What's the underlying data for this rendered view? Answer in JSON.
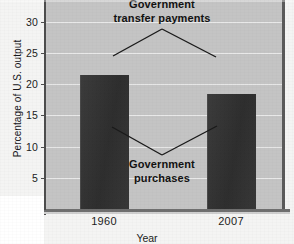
{
  "chart_data": {
    "type": "bar",
    "title": "",
    "xlabel": "Year",
    "ylabel": "Percentage of U.S. output",
    "categories": [
      "1960",
      "2007"
    ],
    "values": [
      21.5,
      18.5
    ],
    "series": [
      {
        "name": "Government purchases",
        "values": [
          21.5,
          18.5
        ]
      }
    ],
    "ylim": [
      0,
      35
    ],
    "ytick_labels": [
      "0",
      "5",
      "10",
      "15",
      "20",
      "25",
      "30",
      "35"
    ],
    "ytick_values": [
      0,
      5,
      10,
      15,
      20,
      25,
      30,
      35
    ],
    "grid": true,
    "legend_position": "none",
    "annotations": [
      {
        "id": "transfer",
        "text_line1": "Government",
        "text_line2": "transfer payments",
        "full_text": "Government transfer payments"
      },
      {
        "id": "purchases",
        "text_line1": "Government",
        "text_line2": "purchases",
        "full_text": "Government purchases"
      }
    ],
    "colors": {
      "bar": "#313131",
      "plot_background": "#c4c4c4",
      "gridline": "#e9e9e9",
      "axis": "#4d4d4d",
      "text": "#1c1c1c",
      "annotation_text": "#121212"
    }
  },
  "axes": {
    "y_title": "Percentage of U.S. output",
    "x_title": "Year"
  },
  "yticks": [
    {
      "label": "35",
      "value": 35
    },
    {
      "label": "30",
      "value": 30
    },
    {
      "label": "25",
      "value": 25
    },
    {
      "label": "20",
      "value": 20
    },
    {
      "label": "15",
      "value": 15
    },
    {
      "label": "10",
      "value": 10
    },
    {
      "label": "5",
      "value": 5
    },
    {
      "label": "0",
      "value": 0
    }
  ],
  "xticks": [
    {
      "label": "1960"
    },
    {
      "label": "2007"
    }
  ],
  "bars": [
    {
      "category": "1960",
      "value": 21.5
    },
    {
      "category": "2007",
      "value": 18.5
    }
  ],
  "annotations": {
    "transfer": {
      "line1": "Government",
      "line2": "transfer payments"
    },
    "purchases": {
      "line1": "Government",
      "line2": "purchases"
    }
  }
}
